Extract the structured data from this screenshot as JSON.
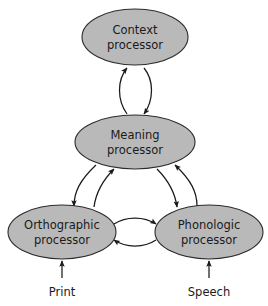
{
  "diagram": {
    "background_color": "#ffffff",
    "node_fill_color": "#b9b9b9",
    "node_stroke_color": "#2b2b2b",
    "text_color": "#1a1a1a",
    "arrow_color": "#1a1a1a"
  },
  "nodes": [
    {
      "id": "context",
      "line1": "Context",
      "line2": "processor",
      "cx": 135,
      "cy": 37,
      "rx": 53,
      "ry": 28
    },
    {
      "id": "meaning",
      "line1": "Meaning",
      "line2": "processor",
      "cx": 135,
      "cy": 142,
      "rx": 60,
      "ry": 27
    },
    {
      "id": "orthographic",
      "line1": "Orthographic",
      "line2": "processor",
      "cx": 62,
      "cy": 232,
      "rx": 54,
      "ry": 27
    },
    {
      "id": "phonologic",
      "line1": "Phonologic",
      "line2": "processor",
      "cx": 209,
      "cy": 232,
      "rx": 54,
      "ry": 27
    }
  ],
  "connections": [
    {
      "id": "context-meaning",
      "from": "meaning",
      "to": "context",
      "direction": "bidirectional",
      "style": "curved-pair"
    },
    {
      "id": "meaning-orthographic",
      "from": "meaning",
      "to": "orthographic",
      "direction": "bidirectional",
      "style": "curved-pair"
    },
    {
      "id": "meaning-phonologic",
      "from": "meaning",
      "to": "phonologic",
      "direction": "bidirectional",
      "style": "curved-pair"
    },
    {
      "id": "orthographic-phonologic",
      "from": "orthographic",
      "to": "phonologic",
      "direction": "bidirectional",
      "style": "curved-pair"
    }
  ],
  "inputs": [
    {
      "id": "print",
      "label": "Print",
      "target": "orthographic",
      "label_x": 62,
      "label_y": 292,
      "line_x": 62,
      "line_y_start": 278,
      "line_y_end": 261
    },
    {
      "id": "speech",
      "label": "Speech",
      "target": "phonologic",
      "label_x": 209,
      "label_y": 292,
      "line_x": 209,
      "line_y_start": 278,
      "line_y_end": 261
    }
  ]
}
